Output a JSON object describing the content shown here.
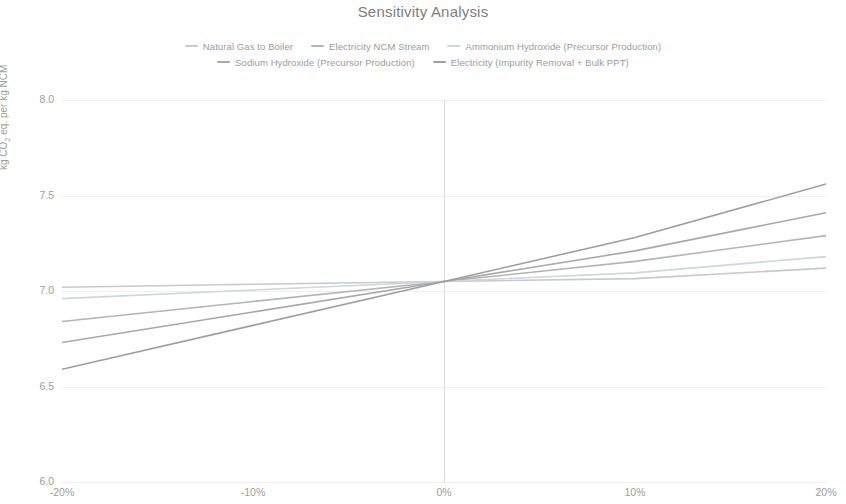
{
  "chart_data": {
    "type": "line",
    "title": "Sensitivity Analysis",
    "xlabel": "",
    "ylabel": "kg CO2 eq. per kg NCM",
    "ylabel_prefix": "kg CO",
    "ylabel_sub": "2",
    "ylabel_suffix": " eq. per kg NCM",
    "x": [
      -20,
      -10,
      0,
      10,
      20
    ],
    "xticklabels": [
      "-20%",
      "-10%",
      "0%",
      "10%",
      "20%"
    ],
    "yticklabels": [
      "8.0",
      "7.5",
      "7.0",
      "6.5",
      "6.0"
    ],
    "yticks": [
      8.0,
      7.5,
      7.0,
      6.5,
      6.0
    ],
    "xlim": [
      -20,
      20
    ],
    "ylim": [
      6.0,
      8.0
    ],
    "grid": true,
    "legend_position": "top-center",
    "baseline_value": 7.05,
    "series": [
      {
        "name": "Natural Gas to Boiler",
        "color": "#c9c9c9",
        "values": [
          7.02,
          7.035,
          7.05,
          7.065,
          7.12
        ]
      },
      {
        "name": "Electricity NCM Stream",
        "color": "#b4b4b4",
        "values": [
          6.84,
          6.945,
          7.05,
          7.155,
          7.29
        ]
      },
      {
        "name": "Ammonium Hydroxide (Precursor Production)",
        "color": "#cdd5de",
        "values": [
          6.96,
          7.005,
          7.05,
          7.095,
          7.18
        ]
      },
      {
        "name": "Sodium Hydroxide (Precursor Production)",
        "color": "#a8a8a8",
        "values": [
          6.73,
          6.89,
          7.05,
          7.21,
          7.41
        ]
      },
      {
        "name": "Electricity (Impurity Removal + Bulk PPT)",
        "color": "#9e9e9e",
        "values": [
          6.59,
          6.82,
          7.05,
          7.28,
          7.56
        ]
      }
    ]
  },
  "legend": {
    "row1": [
      "Natural Gas to Boiler",
      "Electricity NCM Stream",
      "Ammonium Hydroxide (Precursor Production)"
    ],
    "row2": [
      "Sodium Hydroxide (Precursor Production)",
      "Electricity (Impurity Removal + Bulk PPT)"
    ]
  }
}
